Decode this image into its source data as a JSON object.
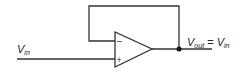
{
  "diagram": {
    "input_label": {
      "main": "V",
      "sub": "in"
    },
    "output_label": {
      "main": "V",
      "sub": "out",
      "eq": " = ",
      "rhs_main": "V",
      "rhs_sub": "in"
    },
    "opamp": {
      "minus_symbol": "−",
      "plus_symbol": "+"
    },
    "colors": {
      "line": "#333333",
      "background": "#ffffff"
    }
  }
}
